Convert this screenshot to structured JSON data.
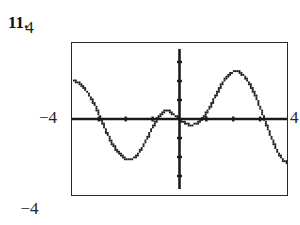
{
  "exercise": {
    "number_label": "11."
  },
  "graph_window": {
    "top_label": "4",
    "bottom_label": "−4",
    "left_label": "−4",
    "right_label": "4",
    "xmin": -4,
    "xmax": 4,
    "ymin": -4,
    "ymax": 4
  },
  "style": {
    "ink": "#1a1a1a",
    "frame": "#2a2a2a",
    "background": "#ffffff"
  },
  "chart_data": {
    "type": "line",
    "title": "",
    "xlabel": "",
    "ylabel": "",
    "xlim": [
      -4,
      4
    ],
    "ylim": [
      -4,
      4
    ],
    "grid": false,
    "legend": null,
    "axes": {
      "x_axis_y": 0,
      "y_axis_x": 0,
      "x_ticks": [
        -3,
        -2,
        -1,
        1,
        2,
        3
      ],
      "y_ticks": [
        -3,
        -2,
        -1,
        1,
        2,
        3
      ],
      "tick_length_px": 5,
      "axis_line_weight": "bold"
    },
    "series": [
      {
        "name": "curve",
        "render": "dotted-pixel-trace",
        "x": [
          -3.95,
          -3.8,
          -3.6,
          -3.4,
          -3.2,
          -3.05,
          -2.9,
          -2.75,
          -2.6,
          -2.45,
          -2.3,
          -2.15,
          -2.0,
          -1.85,
          -1.7,
          -1.55,
          -1.4,
          -1.25,
          -1.1,
          -0.95,
          -0.8,
          -0.65,
          -0.5,
          -0.35,
          -0.2,
          -0.05,
          0.1,
          0.25,
          0.4,
          0.55,
          0.7,
          0.85,
          1.0,
          1.15,
          1.3,
          1.45,
          1.6,
          1.75,
          1.9,
          2.05,
          2.2,
          2.35,
          2.5,
          2.65,
          2.8,
          2.95,
          3.1,
          3.25,
          3.4,
          3.55,
          3.7,
          3.85,
          4.0
        ],
        "y": [
          2.0,
          1.95,
          1.72,
          1.35,
          0.88,
          0.42,
          -0.05,
          -0.55,
          -1.0,
          -1.4,
          -1.72,
          -1.95,
          -2.08,
          -2.12,
          -2.05,
          -1.85,
          -1.55,
          -1.15,
          -0.72,
          -0.3,
          0.05,
          0.3,
          0.42,
          0.38,
          0.22,
          0.03,
          -0.12,
          -0.25,
          -0.3,
          -0.28,
          -0.18,
          0.02,
          0.3,
          0.68,
          1.1,
          1.52,
          1.9,
          2.2,
          2.4,
          2.5,
          2.48,
          2.35,
          2.1,
          1.75,
          1.3,
          0.78,
          0.22,
          -0.35,
          -0.9,
          -1.4,
          -1.82,
          -2.15,
          -2.3
        ]
      }
    ]
  }
}
